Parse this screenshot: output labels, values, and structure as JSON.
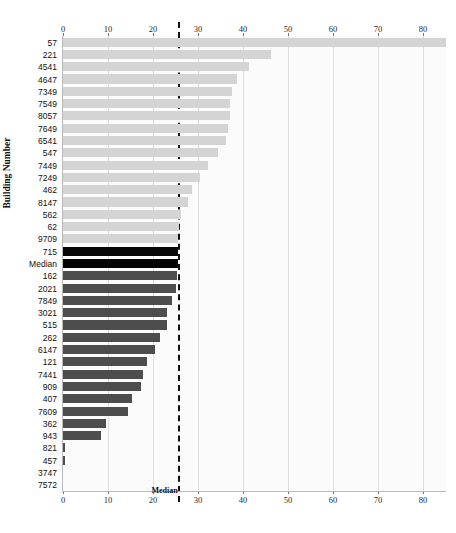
{
  "figure": {
    "clipped_top_text": "",
    "yaxis_title": "Building Number",
    "median_caption": "Median"
  },
  "chart_data": {
    "type": "bar",
    "orientation": "horizontal",
    "title": "",
    "xlabel": "",
    "ylabel": "Building Number",
    "xlim": [
      0,
      85.5
    ],
    "ylim": null,
    "grid": true,
    "legend": null,
    "xticks": [
      0,
      10,
      20,
      30,
      40,
      50,
      60,
      70,
      80
    ],
    "xtick_labels": [
      "0",
      "10",
      "20",
      "30",
      "40",
      "50",
      "60",
      "70",
      "80"
    ],
    "axis_positions": [
      "top",
      "bottom"
    ],
    "annotations": [
      {
        "label": "Median",
        "type": "vline",
        "x": 25.5,
        "style": "dashed",
        "color": "#111111"
      }
    ],
    "categories": [
      "57",
      "221",
      "4541",
      "4647",
      "7349",
      "7549",
      "8057",
      "7649",
      "6541",
      "547",
      "7449",
      "7249",
      "462",
      "8147",
      "562",
      "62",
      "9709",
      "715",
      "Median",
      "162",
      "2021",
      "7849",
      "3021",
      "515",
      "262",
      "6147",
      "121",
      "7441",
      "909",
      "407",
      "7609",
      "362",
      "943",
      "821",
      "457",
      "3747",
      "7572"
    ],
    "values": [
      85.0,
      46.3,
      41.3,
      38.6,
      37.5,
      37.2,
      37.0,
      36.6,
      36.3,
      34.5,
      32.3,
      30.4,
      28.6,
      27.8,
      26.2,
      25.7,
      25.6,
      25.6,
      25.5,
      25.3,
      25.0,
      24.2,
      23.2,
      23.0,
      21.5,
      20.4,
      18.6,
      17.7,
      17.4,
      15.4,
      14.5,
      9.6,
      8.5,
      0.5,
      0.5,
      0.0,
      0.0
    ],
    "bar_colors": [
      "light",
      "light",
      "light",
      "light",
      "light",
      "light",
      "light",
      "light",
      "light",
      "light",
      "light",
      "light",
      "light",
      "light",
      "light",
      "light",
      "light",
      "black",
      "black",
      "dark",
      "dark",
      "dark",
      "dark",
      "dark",
      "dark",
      "dark",
      "dark",
      "dark",
      "dark",
      "dark",
      "dark",
      "dark",
      "dark",
      "dark",
      "dark",
      "dark",
      "dark"
    ],
    "color_key": {
      "light": "#d4d4d4",
      "dark": "#4d4d4d",
      "black": "#050505"
    }
  }
}
